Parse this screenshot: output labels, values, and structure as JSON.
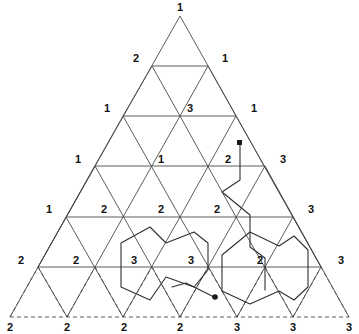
{
  "figure": {
    "type": "sperner-triangulation-diagram",
    "background_color": "#ffffff",
    "ink_color": "#3a3a3a",
    "label_color": "#111111",
    "path_color": "#2f2f2f",
    "grid": {
      "rows": 6,
      "apex": {
        "x": 180,
        "y": 16
      },
      "bottom_left": {
        "x": 10,
        "y": 318
      },
      "bottom_right": {
        "x": 349,
        "y": 318
      },
      "row_spacing": 50.4,
      "dashed_rows": [
        5
      ]
    },
    "chart_data": {
      "type": "diagram",
      "title": "Sperner labelled triangulation of a triangle",
      "xlabel": "",
      "ylabel": "",
      "grid": true,
      "legend": "",
      "vertex_rows": [
        {
          "row": 0,
          "labels": [
            "1"
          ]
        },
        {
          "row": 1,
          "labels": [
            "2",
            "1"
          ]
        },
        {
          "row": 2,
          "labels": [
            "1",
            "3",
            "1"
          ]
        },
        {
          "row": 3,
          "labels": [
            "1",
            "1",
            "2",
            "3"
          ]
        },
        {
          "row": 4,
          "labels": [
            "1",
            "2",
            "2",
            "2",
            "3"
          ]
        },
        {
          "row": 5,
          "labels": [
            "2",
            "2",
            "3",
            "3",
            "2",
            "3"
          ]
        },
        {
          "row": 6,
          "labels": [
            "2",
            "2",
            "2",
            "2",
            "3",
            "3",
            "3"
          ]
        }
      ],
      "label_counts": {
        "1": 9,
        "2": 12,
        "3": 10
      },
      "marked_points": [
        {
          "name": "upper-path-start-dot",
          "x": 240,
          "y": 143
        },
        {
          "name": "lower-path-end-dot",
          "x": 214,
          "y": 297
        }
      ],
      "paths": [
        {
          "name": "open-path-right",
          "closed": false,
          "style": "solid"
        },
        {
          "name": "closed-loop-left",
          "closed": true,
          "style": "solid"
        },
        {
          "name": "closed-loop-right",
          "closed": true,
          "style": "solid"
        },
        {
          "name": "open-path-lower",
          "closed": false,
          "style": "solid"
        }
      ]
    },
    "labels": [
      {
        "text": "1",
        "x": 180,
        "y": 11,
        "anchor": "middle"
      },
      {
        "text": "2",
        "x": 139,
        "y": 62,
        "anchor": "end"
      },
      {
        "text": "1",
        "x": 222,
        "y": 62,
        "anchor": "start"
      },
      {
        "text": "1",
        "x": 110,
        "y": 112,
        "anchor": "end"
      },
      {
        "text": "3",
        "x": 187,
        "y": 112,
        "anchor": "start"
      },
      {
        "text": "1",
        "x": 251,
        "y": 112,
        "anchor": "start"
      },
      {
        "text": "1",
        "x": 81,
        "y": 163,
        "anchor": "end"
      },
      {
        "text": "1",
        "x": 164,
        "y": 163,
        "anchor": "end"
      },
      {
        "text": "2",
        "x": 231,
        "y": 163,
        "anchor": "end"
      },
      {
        "text": "3",
        "x": 280,
        "y": 163,
        "anchor": "start"
      },
      {
        "text": "1",
        "x": 52,
        "y": 213,
        "anchor": "end"
      },
      {
        "text": "2",
        "x": 107,
        "y": 213,
        "anchor": "end"
      },
      {
        "text": "2",
        "x": 164,
        "y": 213,
        "anchor": "end"
      },
      {
        "text": "2",
        "x": 220,
        "y": 213,
        "anchor": "end"
      },
      {
        "text": "3",
        "x": 308,
        "y": 213,
        "anchor": "start"
      },
      {
        "text": "2",
        "x": 24,
        "y": 264,
        "anchor": "end"
      },
      {
        "text": "2",
        "x": 79,
        "y": 264,
        "anchor": "end"
      },
      {
        "text": "3",
        "x": 137,
        "y": 264,
        "anchor": "end"
      },
      {
        "text": "3",
        "x": 194,
        "y": 264,
        "anchor": "end"
      },
      {
        "text": "2",
        "x": 263,
        "y": 264,
        "anchor": "end"
      },
      {
        "text": "3",
        "x": 338,
        "y": 264,
        "anchor": "start"
      },
      {
        "text": "2",
        "x": 10,
        "y": 331,
        "anchor": "middle"
      },
      {
        "text": "2",
        "x": 67,
        "y": 331,
        "anchor": "middle"
      },
      {
        "text": "2",
        "x": 124,
        "y": 331,
        "anchor": "middle"
      },
      {
        "text": "2",
        "x": 180,
        "y": 331,
        "anchor": "middle"
      },
      {
        "text": "3",
        "x": 237,
        "y": 331,
        "anchor": "middle"
      },
      {
        "text": "3",
        "x": 293,
        "y": 331,
        "anchor": "middle"
      },
      {
        "text": "3",
        "x": 349,
        "y": 331,
        "anchor": "middle"
      }
    ]
  }
}
